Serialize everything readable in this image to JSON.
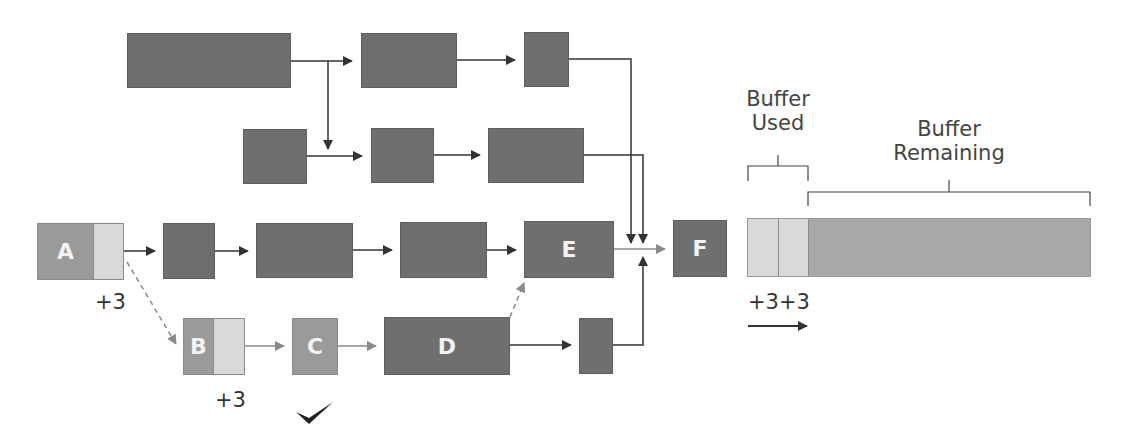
{
  "diagram": {
    "type": "critical-chain-buffer-diagram",
    "colors": {
      "task_dark": "#6f6f6f",
      "task_medium": "#9a9a9a",
      "buffer_light": "#d9d9d9",
      "buffer_remaining": "#a8a8a8",
      "arrow_dark": "#333333",
      "arrow_gray": "#8a8a8a"
    },
    "tasks": {
      "a": {
        "label": "A",
        "delay": "+3"
      },
      "b": {
        "label": "B",
        "delay": "+3"
      },
      "c": {
        "label": "C",
        "status": "check-mark"
      },
      "d": {
        "label": "D"
      },
      "e": {
        "label": "E"
      },
      "f": {
        "label": "F"
      }
    },
    "buffer": {
      "used_label_line1": "Buffer",
      "used_label_line2": "Used",
      "remaining_label_line1": "Buffer",
      "remaining_label_line2": "Remaining",
      "consumed_label": "+3+3",
      "direction_icon": "arrow-right"
    }
  }
}
